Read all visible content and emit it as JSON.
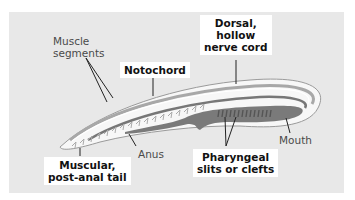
{
  "diagram": {
    "labels": {
      "muscle_segments": [
        "Muscle",
        "segments"
      ],
      "notochord": "Notochord",
      "dorsal_nerve_cord": [
        "Dorsal,",
        "hollow",
        "nerve cord"
      ],
      "mouth": "Mouth",
      "anus": "Anus",
      "pharyngeal_slits": [
        "Pharyngeal",
        "slits or clefts"
      ],
      "tail": [
        "Muscular,",
        "post-anal tail"
      ]
    },
    "colors": {
      "background": "#e8e8e8",
      "body": "#f7f7f7",
      "outline": "#9a9a9a",
      "gut": "#7a7a7a",
      "nerve_cord": "#7a7a7a",
      "label_box": "#ffffff"
    }
  }
}
